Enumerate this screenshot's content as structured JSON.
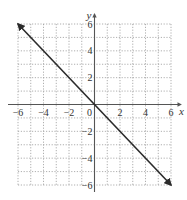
{
  "chart_data": {
    "type": "line",
    "title": "",
    "xlabel": "x",
    "ylabel": "y",
    "xlim": [
      -6,
      6
    ],
    "ylim": [
      -6,
      6
    ],
    "grid": true,
    "grid_style": "dotted",
    "x_ticks": [
      -6,
      -4,
      -2,
      0,
      2,
      4,
      6
    ],
    "y_ticks": [
      -6,
      -4,
      -2,
      2,
      4,
      6
    ],
    "x_tick_labels": [
      "−6",
      "−4",
      "−2",
      "0",
      "2",
      "4",
      "6"
    ],
    "y_tick_labels": [
      "−6",
      "−4",
      "−2",
      "2",
      "4",
      "6"
    ],
    "series": [
      {
        "name": "y = -x",
        "equation": "y = -x",
        "x": [
          -6,
          6
        ],
        "y": [
          6,
          -6
        ],
        "arrows": "both",
        "color": "#2b2b2b"
      }
    ],
    "legend": null
  },
  "labels": {
    "x_axis": "x",
    "y_axis": "y",
    "origin": "0"
  }
}
